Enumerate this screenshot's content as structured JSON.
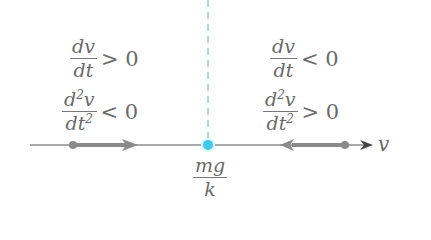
{
  "diagram": {
    "type": "phase_line",
    "left_region": {
      "first_derivative": {
        "num": "dv",
        "den": "dt",
        "relation": "> 0"
      },
      "second_derivative": {
        "num_prefix": "d",
        "num_sup": "2",
        "num_suffix": "v",
        "den_prefix": "dt",
        "den_sup": "2",
        "relation": "< 0"
      },
      "arrow_direction": "right"
    },
    "right_region": {
      "first_derivative": {
        "num": "dv",
        "den": "dt",
        "relation": "< 0"
      },
      "second_derivative": {
        "num_prefix": "d",
        "num_sup": "2",
        "num_suffix": "v",
        "den_prefix": "dt",
        "den_sup": "2",
        "relation": "> 0"
      },
      "arrow_direction": "left"
    },
    "equilibrium": {
      "num": "mg",
      "den": "k",
      "color": "#3fc7e6"
    },
    "axis_label": "v",
    "colors": {
      "axis": "#555555",
      "flow_arrow": "#8a8a8a",
      "dashed_line": "#7fd6e6",
      "equilibrium_point": "#3fc7e6"
    }
  }
}
